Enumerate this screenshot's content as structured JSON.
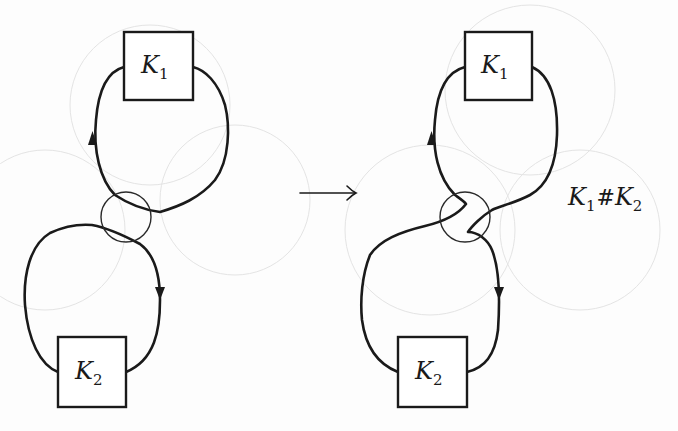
{
  "figure": {
    "left": {
      "top_box": {
        "symbol": "K",
        "subscript": "1"
      },
      "bottom_box": {
        "symbol": "K",
        "subscript": "2"
      }
    },
    "arrow": {
      "glyph": "→"
    },
    "right": {
      "top_box": {
        "symbol": "K",
        "subscript": "1"
      },
      "bottom_box": {
        "symbol": "K",
        "subscript": "2"
      },
      "result_label": {
        "k1": "K",
        "k1_sub": "1",
        "op": "#",
        "k2": "K",
        "k2_sub": "2"
      }
    }
  },
  "colors": {
    "ink": "#1a1a1a",
    "background": "#fdfdfd",
    "ghost": "#e4e4e4"
  }
}
